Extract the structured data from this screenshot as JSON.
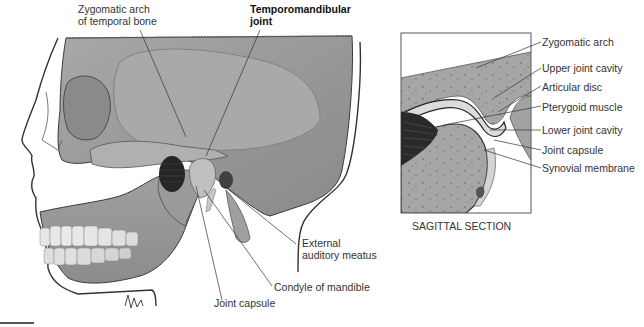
{
  "figure": {
    "main_view": "lateral skull with temporomandibular joint",
    "inset_view": "sagittal section of temporomandibular joint",
    "colors": {
      "bone": "#9c9c9c",
      "bone_light": "#b4b4b4",
      "bone_dark": "#7a7a7a",
      "outline": "#333333",
      "muscle": "#2b2b2b",
      "disc": "#d8d8d8",
      "teeth": "#e8e8e8"
    }
  },
  "labels": {
    "zygomatic_arch_temporal": "Zygomatic arch\nof temporal bone",
    "tmj_title": "Temporomandibular\njoint",
    "external_auditory_meatus": "External\nauditory meatus",
    "condyle_of_mandible": "Condyle of mandible",
    "joint_capsule_main": "Joint capsule",
    "sagittal_section": "SAGITTAL SECTION",
    "inset": [
      "Zygomatic arch",
      "Upper joint cavity",
      "Articular disc",
      "Pterygoid muscle",
      "Lower joint cavity",
      "Joint capsule",
      "Synovial membrane"
    ]
  }
}
